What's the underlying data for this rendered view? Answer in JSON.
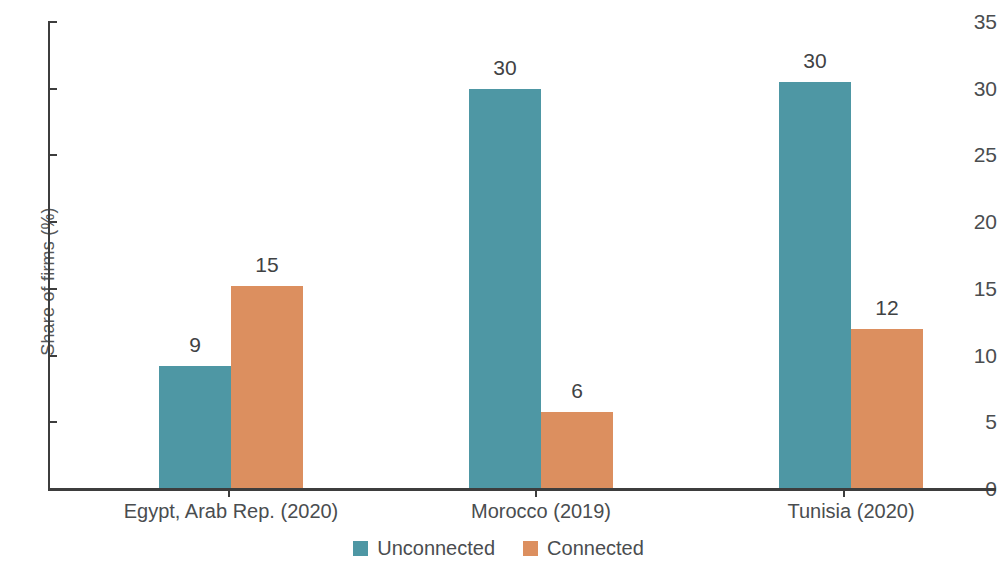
{
  "chart_data": {
    "type": "bar",
    "title": "",
    "xlabel": "",
    "ylabel": "Share of firms (%)",
    "categories": [
      "Egypt, Arab Rep. (2020)",
      "Morocco (2019)",
      "Tunisia (2020)"
    ],
    "series": [
      {
        "name": "Unconnected",
        "color": "#4E97A4",
        "values": [
          9.2,
          30.0,
          30.5
        ],
        "labels": [
          "9",
          "30",
          "30"
        ]
      },
      {
        "name": "Connected",
        "color": "#DC8F5F",
        "values": [
          15.2,
          5.8,
          12.0
        ],
        "labels": [
          "15",
          "6",
          "12"
        ]
      }
    ],
    "ylim": [
      0,
      35
    ],
    "yticks": [
      0,
      5,
      10,
      15,
      20,
      25,
      30,
      35
    ],
    "ytick_labels": [
      "0",
      "5",
      "10",
      "15",
      "20",
      "25",
      "30",
      "35"
    ],
    "grid": false,
    "legend_position": "bottom"
  },
  "legend": {
    "items": [
      {
        "label": "Unconnected",
        "color": "#4E97A4",
        "swatch_name": "legend-swatch-unconnected"
      },
      {
        "label": "Connected",
        "color": "#DC8F5F",
        "swatch_name": "legend-swatch-connected"
      }
    ]
  },
  "axes": {
    "y_title": "Share of firms (%)"
  }
}
